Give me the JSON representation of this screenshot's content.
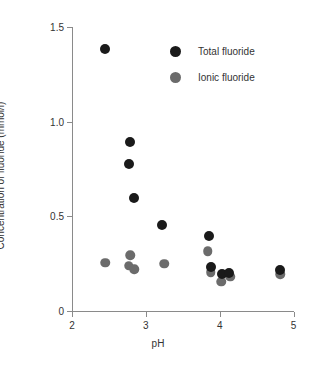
{
  "chart_data": {
    "type": "scatter",
    "title": "",
    "xlabel": "pH",
    "ylabel": "Concentration of fluoride (mmol/l)",
    "xlim": [
      2,
      5
    ],
    "ylim": [
      0,
      1.5
    ],
    "xticks": [
      "2",
      "3",
      "4",
      "5"
    ],
    "xtick_values": [
      2,
      3,
      4,
      5
    ],
    "yticks": [
      "0",
      "0.5",
      "1.0",
      "1.5"
    ],
    "ytick_values": [
      0,
      0.5,
      1.0,
      1.5
    ],
    "grid": false,
    "legend_position": "top-right",
    "series": [
      {
        "name": "Total fluoride",
        "color": "#1a1a1a",
        "points": [
          {
            "x": 2.45,
            "y": 1.385
          },
          {
            "x": 2.79,
            "y": 0.895
          },
          {
            "x": 2.77,
            "y": 0.775
          },
          {
            "x": 2.84,
            "y": 0.595
          },
          {
            "x": 3.22,
            "y": 0.455
          },
          {
            "x": 3.85,
            "y": 0.395
          },
          {
            "x": 3.88,
            "y": 0.235
          },
          {
            "x": 4.03,
            "y": 0.195
          },
          {
            "x": 4.13,
            "y": 0.2
          },
          {
            "x": 4.82,
            "y": 0.215
          }
        ]
      },
      {
        "name": "Ionic fluoride",
        "color": "#6b6b6b",
        "points": [
          {
            "x": 2.45,
            "y": 0.255
          },
          {
            "x": 2.79,
            "y": 0.295
          },
          {
            "x": 2.77,
            "y": 0.24
          },
          {
            "x": 2.84,
            "y": 0.22
          },
          {
            "x": 3.25,
            "y": 0.25
          },
          {
            "x": 3.84,
            "y": 0.315
          },
          {
            "x": 3.88,
            "y": 0.205
          },
          {
            "x": 4.02,
            "y": 0.155
          },
          {
            "x": 4.14,
            "y": 0.18
          },
          {
            "x": 4.82,
            "y": 0.195
          }
        ]
      }
    ]
  },
  "legend": {
    "items": [
      {
        "label": "Total fluoride",
        "marker": "filled-circle-black"
      },
      {
        "label": "Ionic fluoride",
        "marker": "filled-circle-gray"
      }
    ]
  }
}
